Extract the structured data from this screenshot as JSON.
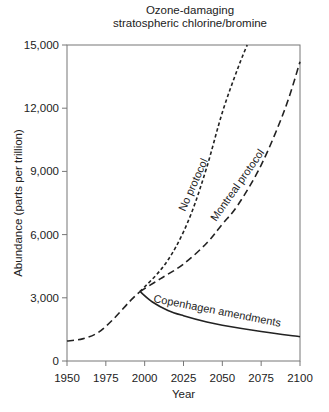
{
  "chart_data": {
    "type": "line",
    "title": "Ozone-damaging stratospheric chlorine/bromine",
    "title_lines": [
      "Ozone-damaging",
      "stratospheric chlorine/bromine"
    ],
    "xlabel": "Year",
    "ylabel": "Abundance (parts per trillion)",
    "xlim": [
      1950,
      2100
    ],
    "ylim": [
      0,
      15000
    ],
    "x_ticks": [
      1950,
      1975,
      2000,
      2025,
      2050,
      2075,
      2100
    ],
    "x_tick_labels": [
      "1950",
      "1975",
      "2000",
      "2025",
      "2050",
      "2075",
      "2100"
    ],
    "y_ticks": [
      0,
      3000,
      6000,
      9000,
      12000,
      15000
    ],
    "y_tick_labels": [
      "0",
      "3,000",
      "6,000",
      "9,000",
      "12,000",
      "15,000"
    ],
    "grid": false,
    "legend": "inline labels on curves",
    "series": [
      {
        "name": "Historical",
        "style": "long-dash",
        "x": [
          1950,
          1960,
          1970,
          1980,
          1990,
          1997
        ],
        "y": [
          950,
          1050,
          1350,
          2000,
          2800,
          3300
        ]
      },
      {
        "name": "No protocol",
        "style": "short-dash",
        "x": [
          1997,
          2010,
          2020,
          2030,
          2040,
          2050,
          2060,
          2066
        ],
        "y": [
          3300,
          4300,
          5400,
          7000,
          9200,
          11800,
          13900,
          15000
        ]
      },
      {
        "name": "Montreal protocol",
        "style": "long-dash",
        "x": [
          1997,
          2010,
          2025,
          2040,
          2050,
          2060,
          2075,
          2090,
          2100
        ],
        "y": [
          3300,
          3900,
          4600,
          5600,
          6500,
          7400,
          9300,
          11900,
          14200
        ]
      },
      {
        "name": "Copenhagen amendments",
        "style": "solid",
        "x": [
          1997,
          2005,
          2015,
          2025,
          2040,
          2050,
          2075,
          2100
        ],
        "y": [
          3300,
          2800,
          2400,
          2150,
          1850,
          1700,
          1400,
          1150
        ]
      }
    ]
  }
}
